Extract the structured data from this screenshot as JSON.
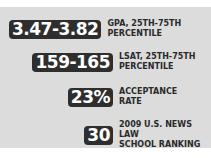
{
  "stats": [
    {
      "value": "3.47-3.82",
      "label_line1": "GPA, 25TH-75TH",
      "label_line2": "PERCENTILE"
    },
    {
      "value": "159-165",
      "label_line1": "LSAT, 25TH-75TH",
      "label_line2": "PERCENTILE"
    },
    {
      "value": "23%",
      "label_line1": "ACCEPTANCE",
      "label_line2": "RATE"
    },
    {
      "value": "30",
      "label_line1": "2009 U.S. NEWS LAW",
      "label_line2": "SCHOOL RANKING"
    }
  ],
  "colors": {
    "panel": "#dcdcdc",
    "badge": "#2e2e2e",
    "badge_text": "#ffffff",
    "label_text": "#2a2a2a"
  }
}
